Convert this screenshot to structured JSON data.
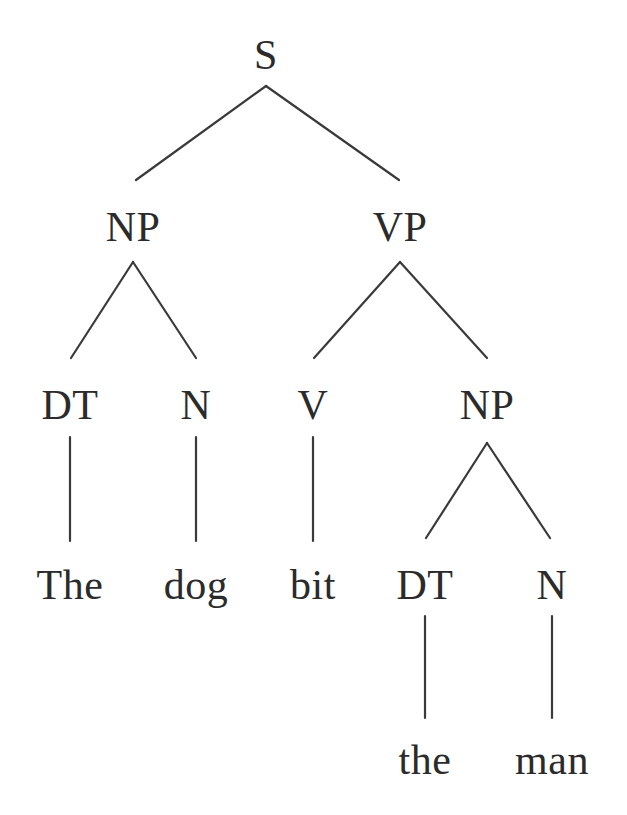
{
  "diagram": {
    "type": "constituency-parse-tree",
    "sentence": "The dog bit the man",
    "canvas": {
      "width": 627,
      "height": 815,
      "background": "#ffffff"
    },
    "line_color": "#3a3a3a",
    "text_color": "#2b2b2b",
    "nodes": [
      {
        "id": "n0",
        "label": "S",
        "kind": "nonterminal",
        "x": 266,
        "y": 55,
        "depth": 0
      },
      {
        "id": "n1",
        "label": "NP",
        "kind": "nonterminal",
        "x": 133,
        "y": 227,
        "depth": 1
      },
      {
        "id": "n2",
        "label": "VP",
        "kind": "nonterminal",
        "x": 400,
        "y": 227,
        "depth": 1
      },
      {
        "id": "n3",
        "label": "DT",
        "kind": "preterminal",
        "x": 70,
        "y": 405,
        "depth": 2
      },
      {
        "id": "n4",
        "label": "N",
        "kind": "preterminal",
        "x": 196,
        "y": 405,
        "depth": 2
      },
      {
        "id": "n5",
        "label": "V",
        "kind": "preterminal",
        "x": 313,
        "y": 405,
        "depth": 2
      },
      {
        "id": "n6",
        "label": "NP",
        "kind": "nonterminal",
        "x": 487,
        "y": 405,
        "depth": 2
      },
      {
        "id": "n7",
        "label": "The",
        "kind": "terminal",
        "x": 70,
        "y": 585,
        "depth": 3
      },
      {
        "id": "n8",
        "label": "dog",
        "kind": "terminal",
        "x": 196,
        "y": 585,
        "depth": 3
      },
      {
        "id": "n9",
        "label": "bit",
        "kind": "terminal",
        "x": 313,
        "y": 585,
        "depth": 3
      },
      {
        "id": "n10",
        "label": "DT",
        "kind": "preterminal",
        "x": 425,
        "y": 585,
        "depth": 3
      },
      {
        "id": "n11",
        "label": "N",
        "kind": "preterminal",
        "x": 552,
        "y": 585,
        "depth": 3
      },
      {
        "id": "n12",
        "label": "the",
        "kind": "terminal",
        "x": 425,
        "y": 760,
        "depth": 4
      },
      {
        "id": "n13",
        "label": "man",
        "kind": "terminal",
        "x": 552,
        "y": 760,
        "depth": 4
      }
    ],
    "edges": [
      {
        "from": "n0",
        "to": "n1",
        "x1": 266,
        "y1": 86,
        "x2": 136,
        "y2": 180
      },
      {
        "from": "n0",
        "to": "n2",
        "x1": 266,
        "y1": 86,
        "x2": 399,
        "y2": 180
      },
      {
        "from": "n1",
        "to": "n3",
        "x1": 133,
        "y1": 262,
        "x2": 71,
        "y2": 358
      },
      {
        "from": "n1",
        "to": "n4",
        "x1": 133,
        "y1": 262,
        "x2": 196,
        "y2": 358
      },
      {
        "from": "n2",
        "to": "n5",
        "x1": 400,
        "y1": 262,
        "x2": 314,
        "y2": 358
      },
      {
        "from": "n2",
        "to": "n6",
        "x1": 400,
        "y1": 262,
        "x2": 487,
        "y2": 358
      },
      {
        "from": "n3",
        "to": "n7",
        "x1": 70,
        "y1": 437,
        "x2": 70,
        "y2": 541
      },
      {
        "from": "n4",
        "to": "n8",
        "x1": 196,
        "y1": 437,
        "x2": 196,
        "y2": 541
      },
      {
        "from": "n5",
        "to": "n9",
        "x1": 313,
        "y1": 437,
        "x2": 313,
        "y2": 541
      },
      {
        "from": "n6",
        "to": "n10",
        "x1": 487,
        "y1": 443,
        "x2": 426,
        "y2": 538
      },
      {
        "from": "n6",
        "to": "n11",
        "x1": 487,
        "y1": 443,
        "x2": 550,
        "y2": 538
      },
      {
        "from": "n10",
        "to": "n12",
        "x1": 425,
        "y1": 616,
        "x2": 425,
        "y2": 718
      },
      {
        "from": "n11",
        "to": "n13",
        "x1": 552,
        "y1": 616,
        "x2": 552,
        "y2": 718
      }
    ]
  }
}
